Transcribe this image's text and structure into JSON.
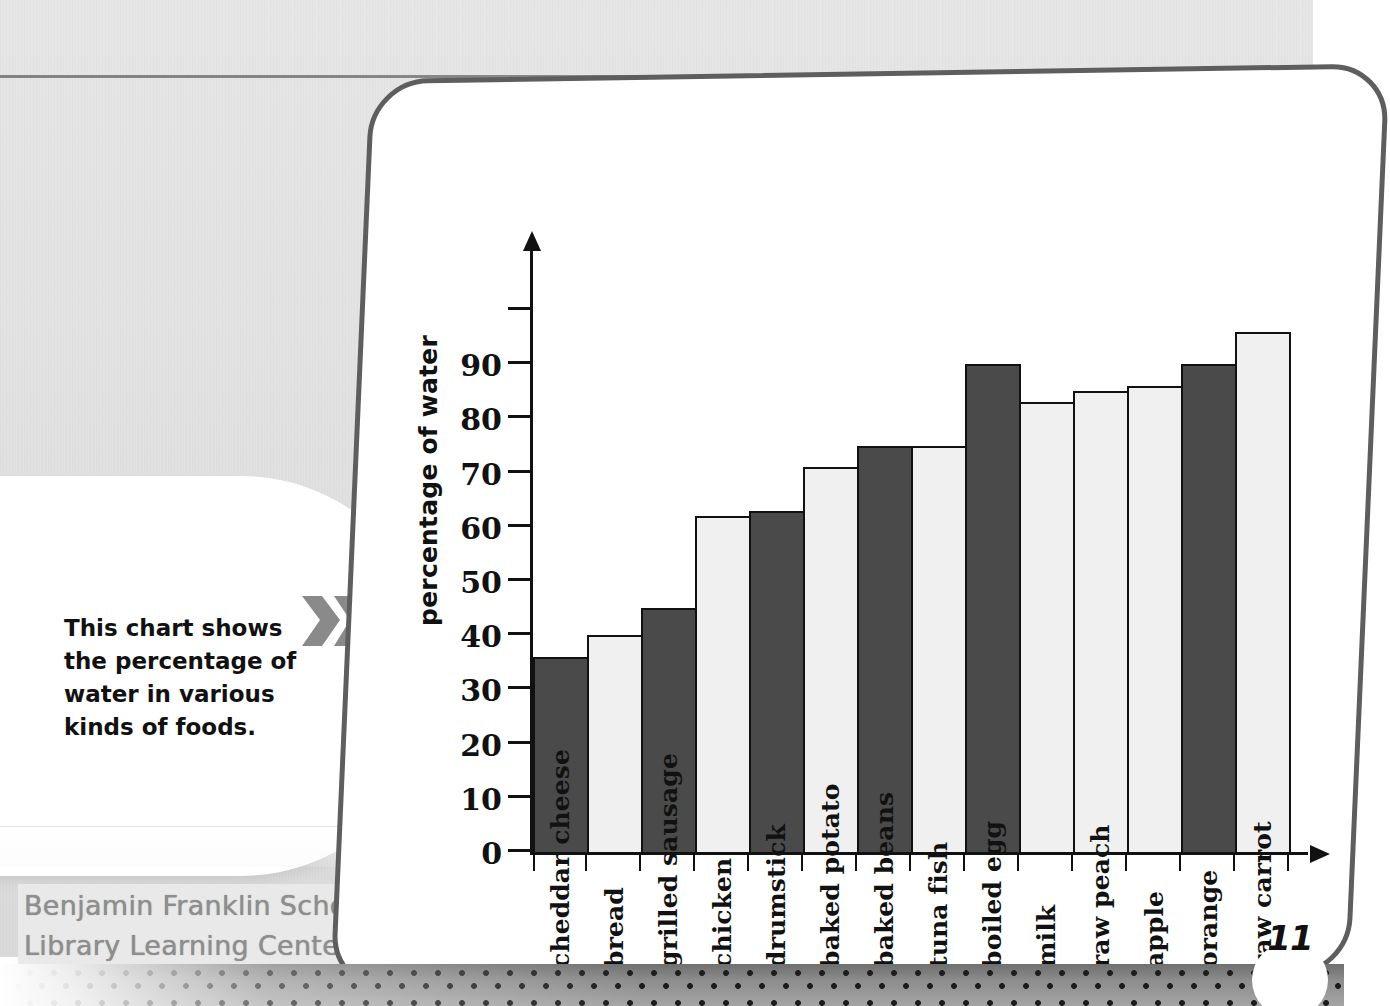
{
  "page": {
    "page_number": "11",
    "library_stamp_line1": "Benjamin Franklin School",
    "library_stamp_line2": "Library Learning Center"
  },
  "callout": {
    "text": "This chart shows the percentage of water in various kinds of foods.",
    "icon": "double-chevron-right-icon"
  },
  "colors": {
    "bar_dark": "#4a4a4a",
    "bar_light": "#f0f0f0",
    "axis": "#111111",
    "panel_border": "#5e5e5e",
    "background": "#e3e3e3",
    "chevron": "#8a8a8a",
    "stamp_text": "#8e8e8e"
  },
  "chart_data": {
    "type": "bar",
    "title": "",
    "xlabel": "",
    "ylabel": "percentage of water",
    "ylim": [
      0,
      100
    ],
    "ytick_labels": [
      "0",
      "10",
      "20",
      "30",
      "40",
      "50",
      "60",
      "70",
      "80",
      "90"
    ],
    "ytick_values": [
      0,
      10,
      20,
      30,
      40,
      50,
      60,
      70,
      80,
      90
    ],
    "minor_tick_above_top_label": 100,
    "grid": false,
    "legend": "none",
    "categories": [
      "cheddar cheese",
      "bread",
      "grilled sausage",
      "chicken",
      "drumstick",
      "baked potato",
      "baked beans",
      "tuna fish",
      "boiled egg",
      "milk",
      "raw peach",
      "apple",
      "orange",
      "raw carrot"
    ],
    "values": [
      36,
      40,
      45,
      62,
      63,
      71,
      75,
      75,
      90,
      83,
      85,
      86,
      90,
      96
    ],
    "bar_shades": [
      "dark",
      "light",
      "dark",
      "light",
      "dark",
      "light",
      "dark",
      "light",
      "dark",
      "light",
      "light",
      "light",
      "dark",
      "light"
    ]
  }
}
